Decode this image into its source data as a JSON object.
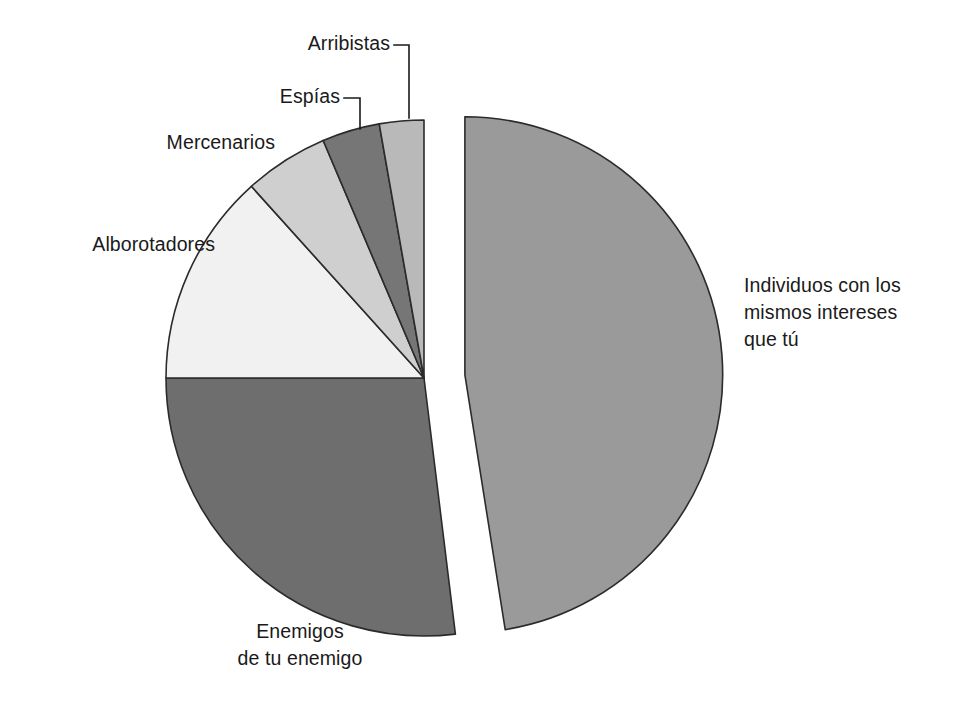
{
  "chart_data": {
    "type": "pie",
    "title": "",
    "subtitle": "",
    "xlabel": "",
    "ylabel": "",
    "legend_position": "none",
    "grid": false,
    "labels_placement": "outside-with-leader-lines",
    "exploded_slice": "Individuos con los mismos intereses que tú",
    "categories": [
      "Individuos con los mismos intereses que tú",
      "Enemigos de tu enemigo",
      "Alborotadores",
      "Mercenarios",
      "Espías",
      "Arribistas"
    ],
    "values": [
      47.5,
      27.0,
      13.0,
      5.5,
      3.5,
      3.5
    ],
    "units": "percent",
    "colors": [
      "#9a9a9a",
      "#6e6e6e",
      "#f1f1f1",
      "#cfcfcf",
      "#767676",
      "#b9b9b9"
    ],
    "slices": [
      {
        "label": "Individuos con los mismos intereses que tú",
        "label_lines": [
          "Individuos con los",
          "mismos intereses",
          "que tú"
        ],
        "value": 47.5,
        "start_angle": 0,
        "end_angle": 171,
        "color": "#9a9a9a",
        "exploded": true,
        "explode_offset_px": 41,
        "leader_line": false
      },
      {
        "label": "Enemigos de tu enemigo",
        "label_lines": [
          "Enemigos",
          "de tu enemigo"
        ],
        "value": 27.0,
        "start_angle": 173,
        "end_angle": 270,
        "color": "#6e6e6e",
        "exploded": false,
        "explode_offset_px": 0,
        "leader_line": false
      },
      {
        "label": "Alborotadores",
        "label_lines": [
          "Alborotadores"
        ],
        "value": 13.0,
        "start_angle": 270,
        "end_angle": 318,
        "color": "#f1f1f1",
        "exploded": false,
        "explode_offset_px": 0,
        "leader_line": false
      },
      {
        "label": "Mercenarios",
        "label_lines": [
          "Mercenarios"
        ],
        "value": 5.5,
        "start_angle": 318,
        "end_angle": 337,
        "color": "#cfcfcf",
        "exploded": false,
        "explode_offset_px": 0,
        "leader_line": false
      },
      {
        "label": "Espías",
        "label_lines": [
          "Espías"
        ],
        "value": 3.5,
        "start_angle": 337,
        "end_angle": 350,
        "color": "#767676",
        "exploded": false,
        "explode_offset_px": 0,
        "leader_line": true
      },
      {
        "label": "Arribistas",
        "label_lines": [
          "Arribistas"
        ],
        "value": 3.5,
        "start_angle": 350,
        "end_angle": 360,
        "color": "#b9b9b9",
        "exploded": false,
        "explode_offset_px": 0,
        "leader_line": true
      }
    ],
    "background_color": "#ffffff",
    "stroke_color": "#2b2b2b",
    "text_color": "#1a1a1a"
  },
  "labels": {
    "individuos": "Individuos con los\nmismos intereses\nque tú",
    "enemigos": "Enemigos\nde tu enemigo",
    "alborotadores": "Alborotadores",
    "mercenarios": "Mercenarios",
    "espias": "Espías",
    "arribistas": "Arribistas"
  }
}
